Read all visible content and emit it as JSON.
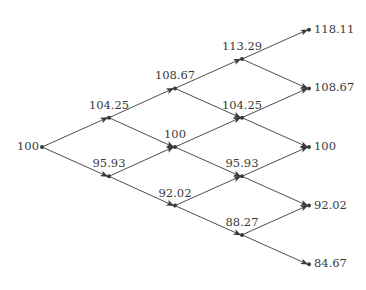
{
  "diagram": {
    "type": "binomial-tree",
    "steps": 4,
    "line_color": "#3a3a3a",
    "text_color": "#3a3a3a",
    "levels": [
      {
        "step": 0,
        "values": [
          "100"
        ]
      },
      {
        "step": 1,
        "values": [
          "104.25",
          "95.93"
        ]
      },
      {
        "step": 2,
        "values": [
          "108.67",
          "100",
          "92.02"
        ]
      },
      {
        "step": 3,
        "values": [
          "113.29",
          "104.25",
          "95.93",
          "88.27"
        ]
      },
      {
        "step": 4,
        "values": [
          "118.11",
          "108.67",
          "100",
          "92.02",
          "84.67"
        ]
      }
    ]
  }
}
